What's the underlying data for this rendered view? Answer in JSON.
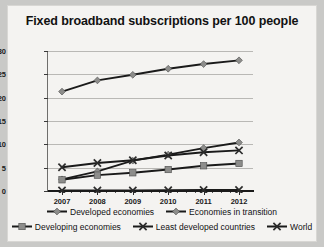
{
  "chart_data": {
    "type": "line",
    "title": "Fixed broadband subscriptions per 100 people",
    "xlabel": "",
    "ylabel": "",
    "x": [
      "2007",
      "2008",
      "2009",
      "2010",
      "2011",
      "2012"
    ],
    "categories": [
      "2007",
      "2008",
      "2009",
      "2010",
      "2011",
      "2012"
    ],
    "ylim": [
      0,
      30
    ],
    "yticks": [
      0,
      5,
      10,
      15,
      20,
      25,
      30
    ],
    "ytick_labels": [
      "0",
      "5",
      "10",
      "15",
      "20",
      "25",
      "30"
    ],
    "grid": true,
    "legend_position": "bottom",
    "series": [
      {
        "name": "Developed economies",
        "marker": "diamond",
        "values": [
          21.3,
          23.7,
          24.9,
          26.2,
          27.2,
          28.0
        ]
      },
      {
        "name": "Economies in transition",
        "marker": "diamond",
        "values": [
          2.5,
          4.2,
          6.5,
          7.8,
          9.2,
          10.4
        ]
      },
      {
        "name": "Developing economies",
        "marker": "square",
        "values": [
          2.4,
          3.4,
          3.9,
          4.6,
          5.4,
          5.9
        ]
      },
      {
        "name": "Least developed countries",
        "marker": "cross",
        "values": [
          0.1,
          0.1,
          0.1,
          0.15,
          0.2,
          0.2
        ]
      },
      {
        "name": "World",
        "marker": "cross",
        "values": [
          5.1,
          6.0,
          6.6,
          7.6,
          8.3,
          8.7
        ]
      }
    ],
    "colors": {
      "line": "#1a1a1a",
      "marker_fill": "#8d8d8b",
      "grid": "#b9b8b5",
      "background": "#f4f3f1"
    }
  },
  "legend": {
    "row1": [
      {
        "label": "Developed economies",
        "marker": "diamond"
      },
      {
        "label": "Economies in transition",
        "marker": "diamond"
      }
    ],
    "row2": [
      {
        "label": "Developing economies",
        "marker": "square"
      },
      {
        "label": "Least developed countries",
        "marker": "cross"
      },
      {
        "label": "World",
        "marker": "cross"
      }
    ]
  }
}
